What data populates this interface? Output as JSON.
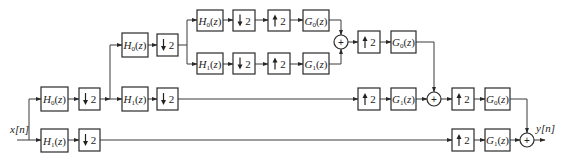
{
  "diagram": {
    "type": "three-level-octave-filter-bank",
    "input_label": "x[n]",
    "output_label": "y[n]",
    "plus_symbol": "+",
    "analysis_filters": {
      "lowpass": "H0(z)",
      "highpass": "H1(z)"
    },
    "synthesis_filters": {
      "lowpass": "G0(z)",
      "highpass": "G1(z)"
    },
    "downsampler_label": "2",
    "upsampler_label": "2",
    "blocks": [
      {
        "id": "a1-h0",
        "kind": "filter",
        "filter": "H",
        "sub": "0"
      },
      {
        "id": "a1-h0-down",
        "kind": "down",
        "factor": "2"
      },
      {
        "id": "a1-h1",
        "kind": "filter",
        "filter": "H",
        "sub": "1"
      },
      {
        "id": "a1-h1-down",
        "kind": "down",
        "factor": "2"
      },
      {
        "id": "a2-h0",
        "kind": "filter",
        "filter": "H",
        "sub": "0"
      },
      {
        "id": "a2-h0-down",
        "kind": "down",
        "factor": "2"
      },
      {
        "id": "a2-h1",
        "kind": "filter",
        "filter": "H",
        "sub": "1"
      },
      {
        "id": "a2-h1-down",
        "kind": "down",
        "factor": "2"
      },
      {
        "id": "a3-h0",
        "kind": "filter",
        "filter": "H",
        "sub": "0"
      },
      {
        "id": "a3-h0-down",
        "kind": "down",
        "factor": "2"
      },
      {
        "id": "a3-h1",
        "kind": "filter",
        "filter": "H",
        "sub": "1"
      },
      {
        "id": "a3-h1-down",
        "kind": "down",
        "factor": "2"
      },
      {
        "id": "s3-h0-up",
        "kind": "up",
        "factor": "2"
      },
      {
        "id": "s3-g0",
        "kind": "filter",
        "filter": "G",
        "sub": "0"
      },
      {
        "id": "s3-h1-up",
        "kind": "up",
        "factor": "2"
      },
      {
        "id": "s3-g1",
        "kind": "filter",
        "filter": "G",
        "sub": "1"
      },
      {
        "id": "s2-low-up",
        "kind": "up",
        "factor": "2"
      },
      {
        "id": "s2-g0",
        "kind": "filter",
        "filter": "G",
        "sub": "0"
      },
      {
        "id": "s2-high-up",
        "kind": "up",
        "factor": "2"
      },
      {
        "id": "s2-g1",
        "kind": "filter",
        "filter": "G",
        "sub": "1"
      },
      {
        "id": "s1-low-up",
        "kind": "up",
        "factor": "2"
      },
      {
        "id": "s1-g0",
        "kind": "filter",
        "filter": "G",
        "sub": "0"
      },
      {
        "id": "s1-high-up",
        "kind": "up",
        "factor": "2"
      },
      {
        "id": "s1-g1",
        "kind": "filter",
        "filter": "G",
        "sub": "1"
      }
    ],
    "adders": [
      "sum-level3",
      "sum-level2",
      "sum-output"
    ]
  }
}
